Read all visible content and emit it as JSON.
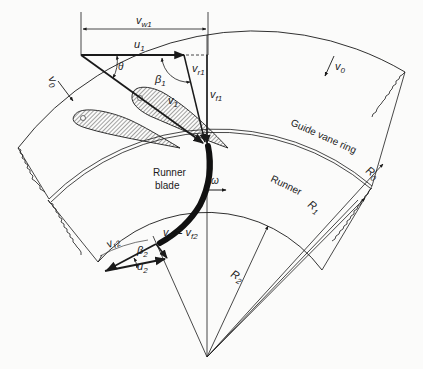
{
  "diagram": {
    "labels": {
      "vw1": "v",
      "vw1_sub": "w1",
      "u1": "u",
      "u1_sub": "1",
      "theta": "θ",
      "beta1": "β",
      "beta1_sub": "1",
      "vr1": "v",
      "vr1_sub": "r1",
      "v1": "v",
      "v1_sub": "1",
      "vf1": "v",
      "vf1_sub": "f1",
      "v0_left": "v",
      "v0_left_sub": "0",
      "v0_right": "v",
      "v0_right_sub": "0",
      "guide_vane_ring": "Guide vane ring",
      "runner_blade_line1": "Runner",
      "runner_blade_line2": "blade",
      "omega": "ω",
      "runner": "Runner",
      "r0": "R",
      "r0_sub": "0",
      "r1": "R",
      "r1_sub": "1",
      "r2": "R",
      "r2_sub": "2",
      "vr2": "v",
      "vr2_sub": "r2",
      "beta2": "β",
      "beta2_sub": "2",
      "u2": "u",
      "u2_sub": "2",
      "v2_eq": "v",
      "v2_eq_sub": "2",
      "v2_eq_mid": " = v",
      "vf2_sub": "f2"
    },
    "colors": {
      "ink": "#1a1a1a",
      "paper": "#fbfbfa"
    }
  }
}
